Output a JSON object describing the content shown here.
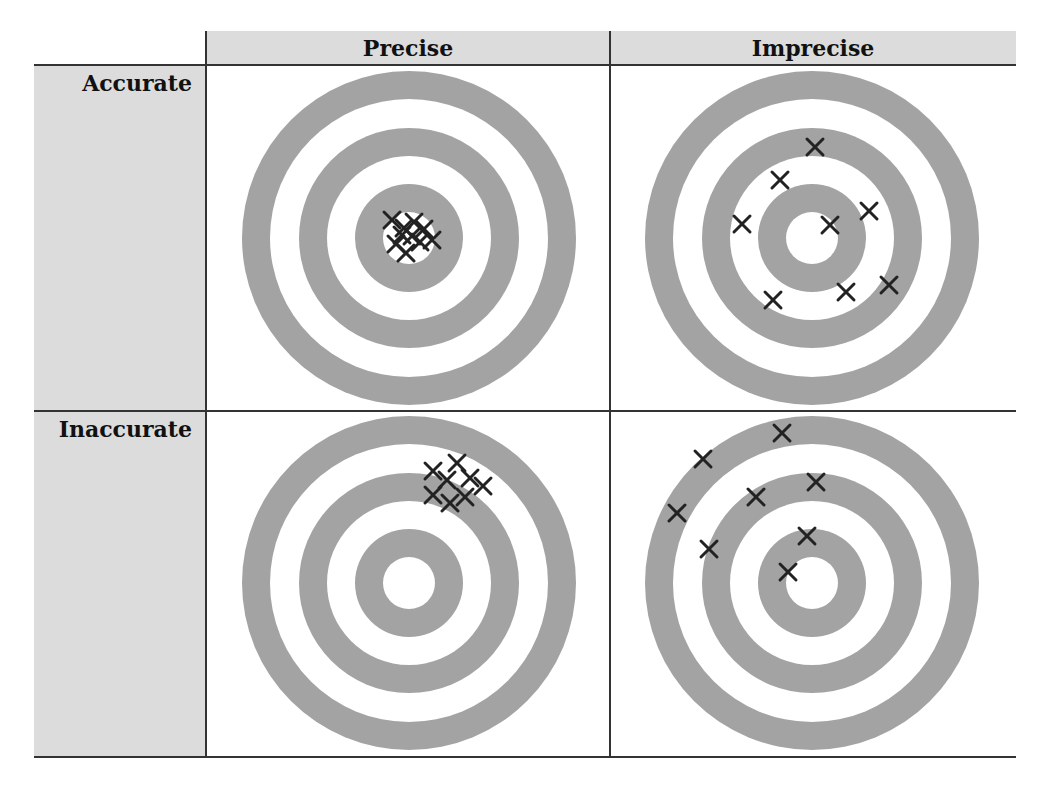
{
  "diagram": {
    "columns": [
      {
        "label": "Precise"
      },
      {
        "label": "Imprecise"
      }
    ],
    "rows": [
      {
        "label": "Accurate"
      },
      {
        "label": "Inaccurate"
      }
    ],
    "colors": {
      "ring": "#a3a3a3",
      "header_bg": "#dcdcdc",
      "marker": "#222222",
      "gridline": "#333333"
    },
    "target_rings_radii": [
      167,
      139,
      110,
      82,
      54,
      26
    ],
    "cells": [
      {
        "row": "Accurate",
        "col": "Precise",
        "center": [
          409,
          238
        ],
        "hits": [
          [
            392,
            220
          ],
          [
            404,
            228
          ],
          [
            414,
            222
          ],
          [
            424,
            229
          ],
          [
            396,
            244
          ],
          [
            406,
            253
          ],
          [
            420,
            242
          ],
          [
            432,
            240
          ],
          [
            412,
            236
          ],
          [
            402,
            235
          ]
        ]
      },
      {
        "row": "Accurate",
        "col": "Imprecise",
        "center": [
          812,
          238
        ],
        "hits": [
          [
            815,
            147
          ],
          [
            780,
            180
          ],
          [
            742,
            224
          ],
          [
            830,
            225
          ],
          [
            869,
            211
          ],
          [
            773,
            300
          ],
          [
            846,
            292
          ],
          [
            889,
            285
          ]
        ]
      },
      {
        "row": "Inaccurate",
        "col": "Precise",
        "center": [
          409,
          583
        ],
        "hits": [
          [
            433,
            471
          ],
          [
            457,
            463
          ],
          [
            447,
            480
          ],
          [
            470,
            478
          ],
          [
            483,
            486
          ],
          [
            433,
            495
          ],
          [
            450,
            503
          ],
          [
            465,
            497
          ]
        ]
      },
      {
        "row": "Inaccurate",
        "col": "Imprecise",
        "center": [
          812,
          583
        ],
        "hits": [
          [
            782,
            433
          ],
          [
            703,
            459
          ],
          [
            677,
            513
          ],
          [
            756,
            497
          ],
          [
            816,
            482
          ],
          [
            709,
            549
          ],
          [
            807,
            536
          ],
          [
            788,
            572
          ]
        ]
      }
    ]
  }
}
